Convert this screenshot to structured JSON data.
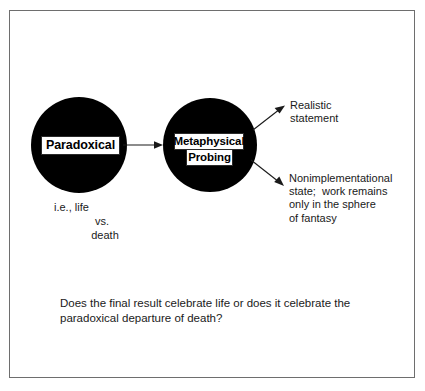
{
  "figure": {
    "background_color": "#ffffff",
    "border_color": "#6e6e6e",
    "node_fill_color": "#000000",
    "label_fill_color": "#ffffff",
    "text_color": "#1a1a1a",
    "connector_color": "#1a1a1a"
  },
  "nodes": {
    "left": {
      "label": "Paradoxical",
      "shape": "filled-circle"
    },
    "right": {
      "label_line_1": "Metaphysical",
      "label_line_2": "Probing",
      "shape": "filled-circle"
    }
  },
  "subtext": {
    "line_1": "i.e., life",
    "line_2": "vs.",
    "line_3": "death"
  },
  "annotations": {
    "upper": "Realistic\nstatement",
    "lower": "Nonimplementational\nstate;  work remains\nonly in the sphere\nof fantasy"
  },
  "caption": {
    "text": "Does the final result celebrate life or does it celebrate the\nparadoxical departure of death?"
  },
  "connectors": {
    "main_arrow": "arrow-right",
    "upper_branch": "arrow-up-right",
    "lower_branch": "arrow-down-right"
  }
}
